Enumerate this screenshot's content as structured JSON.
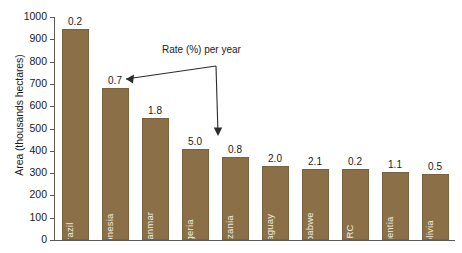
{
  "chart_data": {
    "type": "bar",
    "title": "",
    "xlabel": "",
    "ylabel": "Area (thousands hectares)",
    "ylim": [
      0,
      1000
    ],
    "ytick_labels": [
      "1000",
      "900",
      "800",
      "700",
      "600",
      "500",
      "400",
      "300",
      "200",
      "100",
      "0"
    ],
    "yticks": [
      1000,
      900,
      800,
      700,
      600,
      500,
      400,
      300,
      200,
      100,
      0
    ],
    "grid": false,
    "legend": "none",
    "bar_color": "#8a6f47",
    "categories": [
      "Brazil",
      "Indonesia",
      "Mayanmar",
      "Nigeria",
      "Tanzania",
      "Paraguay",
      "Zimbabwe",
      "DRC",
      "Argentia",
      "Bolivia"
    ],
    "values": [
      985,
      680,
      545,
      410,
      372,
      330,
      320,
      318,
      305,
      295
    ],
    "data_labels": [
      "0.2",
      "0.7",
      "1.8",
      "5.0",
      "0.8",
      "2.0",
      "2.1",
      "0.2",
      "1.1",
      "0.5"
    ],
    "data_label_meaning": "Rate (%) per year",
    "annotations": [
      {
        "text": "Rate (%) per year",
        "points_to": [
          "Indonesia",
          "Nigeria"
        ]
      }
    ]
  },
  "annotation": {
    "label": "Rate (%) per year"
  }
}
